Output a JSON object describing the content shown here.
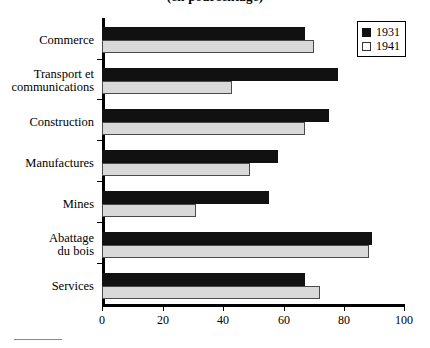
{
  "chart_data": {
    "type": "bar",
    "orientation": "horizontal",
    "title": "(en pourcentage)",
    "xlabel": "",
    "ylabel": "",
    "xlim": [
      0,
      100
    ],
    "xticks": [
      0,
      20,
      40,
      60,
      80,
      100
    ],
    "xtick_labels": [
      "0",
      "20",
      "40",
      "60",
      "80",
      "100"
    ],
    "grid": false,
    "legend_position": "top-right",
    "categories": [
      "Commerce",
      "Transport et\ncommunications",
      "Construction",
      "Manufactures",
      "Mines",
      "Abattage\ndu bois",
      "Services"
    ],
    "series": [
      {
        "name": "1931",
        "color": "#111111",
        "values": [
          67,
          78,
          75,
          58,
          55,
          89,
          67
        ]
      },
      {
        "name": "1941",
        "color": "#d9d9d9",
        "values": [
          70,
          43,
          67,
          49,
          31,
          88,
          72
        ]
      }
    ]
  },
  "legend": {
    "entries": [
      {
        "label": "1931",
        "swatch": "filled-black-square"
      },
      {
        "label": "1941",
        "swatch": "open-white-square"
      }
    ]
  }
}
